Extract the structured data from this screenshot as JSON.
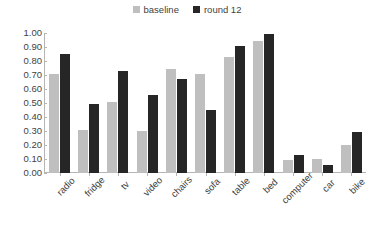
{
  "chart_data": {
    "type": "bar",
    "title": "",
    "subtitle": "",
    "xlabel": "",
    "ylabel": "",
    "ylim": [
      0.0,
      1.0
    ],
    "ytick_step": 0.1,
    "grid": false,
    "legend_position": "top-center",
    "categories": [
      "radio",
      "fridge",
      "tv",
      "video",
      "chairs",
      "sofa",
      "table",
      "bed",
      "computer",
      "car",
      "bike"
    ],
    "ytick_labels": [
      "1.00",
      "0.90",
      "0.80",
      "0.70",
      "0.60",
      "0.50",
      "0.40",
      "0.30",
      "0.20",
      "0.10",
      "0.00"
    ],
    "ytick_values": [
      1.0,
      0.9,
      0.8,
      0.7,
      0.6,
      0.5,
      0.4,
      0.3,
      0.2,
      0.1,
      0.0
    ],
    "series": [
      {
        "name": "baseline",
        "color": "#bfbfbf",
        "values": [
          0.71,
          0.31,
          0.51,
          0.3,
          0.74,
          0.71,
          0.83,
          0.94,
          0.09,
          0.1,
          0.2
        ]
      },
      {
        "name": "round 12",
        "color": "#262626",
        "values": [
          0.85,
          0.49,
          0.73,
          0.56,
          0.67,
          0.45,
          0.91,
          0.99,
          0.13,
          0.06,
          0.29
        ]
      }
    ]
  },
  "colors": {
    "baseline": "#bfbfbf",
    "round_12": "#262626",
    "axis": "#b5b5b5",
    "text": "#3f3f3f",
    "background": "#ffffff"
  }
}
